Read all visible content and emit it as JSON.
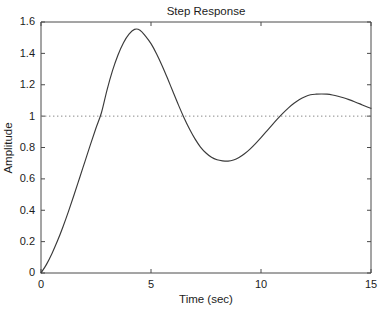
{
  "chart_data": {
    "type": "line",
    "title": "Step Response",
    "xlabel": "Time (sec)",
    "ylabel": "Amplitude",
    "xlim": [
      0,
      15
    ],
    "ylim": [
      0,
      1.6
    ],
    "xticks": [
      0,
      5,
      10,
      15
    ],
    "xtick_labels": [
      "0",
      "5",
      "10",
      "15"
    ],
    "yticks": [
      0,
      0.2,
      0.4,
      0.6,
      0.8,
      1,
      1.2,
      1.4,
      1.6
    ],
    "ytick_labels": [
      "0",
      "0.2",
      "0.4",
      "0.6",
      "0.8",
      "1",
      "1.2",
      "1.4",
      "1.6"
    ],
    "grid": false,
    "legend": "none",
    "line_color": "#3a3a3a",
    "reference_line": {
      "value": 1,
      "style": "dotted",
      "color": "#8a8a8a",
      "label": "steady-state = 1"
    },
    "annotations": {
      "first_peak": {
        "t": 3.68,
        "amplitude": 1.554
      },
      "first_trough": {
        "t": 8.5,
        "amplitude": 0.713
      },
      "second_peak": {
        "t": 13.0,
        "amplitude": 1.14
      },
      "final_value": {
        "t": 15,
        "amplitude": 1.05
      }
    },
    "series": [
      {
        "name": "Step Response",
        "x": [
          0,
          0.25,
          0.5,
          0.75,
          1,
          1.25,
          1.5,
          1.75,
          2,
          2.25,
          2.5,
          2.75,
          3,
          3.25,
          3.5,
          3.75,
          4,
          4.25,
          4.5,
          4.75,
          5,
          5.25,
          5.5,
          5.75,
          6,
          6.25,
          6.5,
          6.75,
          7,
          7.25,
          7.5,
          7.75,
          8,
          8.25,
          8.5,
          8.75,
          9,
          9.25,
          9.5,
          9.75,
          10,
          10.25,
          10.5,
          10.75,
          11,
          11.25,
          11.5,
          11.75,
          12,
          12.25,
          12.5,
          12.75,
          13,
          13.25,
          13.5,
          13.75,
          14,
          14.25,
          14.5,
          14.75,
          15
        ],
        "y": [
          0,
          0.055,
          0.125,
          0.205,
          0.295,
          0.393,
          0.497,
          0.604,
          0.712,
          0.82,
          0.924,
          1.023,
          1.166,
          1.29,
          1.39,
          1.468,
          1.523,
          1.553,
          1.548,
          1.51,
          1.462,
          1.398,
          1.323,
          1.241,
          1.155,
          1.07,
          0.99,
          0.918,
          0.855,
          0.803,
          0.765,
          0.738,
          0.722,
          0.715,
          0.713,
          0.72,
          0.736,
          0.76,
          0.79,
          0.825,
          0.863,
          0.903,
          0.943,
          0.982,
          1.019,
          1.053,
          1.082,
          1.106,
          1.124,
          1.136,
          1.14,
          1.141,
          1.14,
          1.135,
          1.127,
          1.117,
          1.105,
          1.092,
          1.078,
          1.063,
          1.05
        ]
      }
    ]
  },
  "figure": {
    "background_color": "#ffffff",
    "axes_color": "#4a4a4a"
  }
}
